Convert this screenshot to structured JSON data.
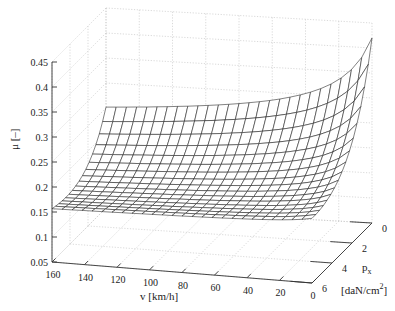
{
  "chart_data": {
    "type": "surface3d",
    "title": "",
    "xlabel": "v [km/h]",
    "ylabel": "p_x [daN/cm^2]",
    "zlabel": "μ [–]",
    "x_ticks": [
      160,
      140,
      120,
      100,
      80,
      60,
      40,
      20,
      0
    ],
    "y_ticks": [
      0,
      2,
      4,
      6
    ],
    "z_ticks": [
      "0.05",
      "0.1",
      "0.15",
      "0.2",
      "0.25",
      "0.3",
      "0.35",
      "0.4",
      "0.45"
    ],
    "xlim": [
      0,
      160
    ],
    "ylim": [
      0,
      6
    ],
    "zlim": [
      0.05,
      0.45
    ],
    "grid": true,
    "mesh": {
      "v_count": 26,
      "p_count": 16
    },
    "surface_description": "Friction coefficient μ as function of speed v and pressure p_x; increases steeply as v→0 and p→0",
    "corner_values": [
      {
        "v": 160,
        "p": 0,
        "mu": 0.25
      },
      {
        "v": 160,
        "p": 6,
        "mu": 0.075
      },
      {
        "v": 0,
        "p": 0,
        "mu": 0.42
      },
      {
        "v": 0,
        "p": 6,
        "mu": 0.09
      }
    ],
    "colors": {
      "mesh_line": "#1a1a1a",
      "mesh_fill": "#ffffff",
      "grid": "#c8c8c8",
      "axis": "#333333"
    }
  },
  "labels": {
    "z_axis_title": "μ [–]",
    "x_axis_title": "v [km/h]",
    "y_axis_title_main": "p",
    "y_axis_title_sub": "x",
    "y_axis_unit": "[daN/cm",
    "y_axis_unit_sup": "2",
    "y_axis_unit_close": "]"
  }
}
